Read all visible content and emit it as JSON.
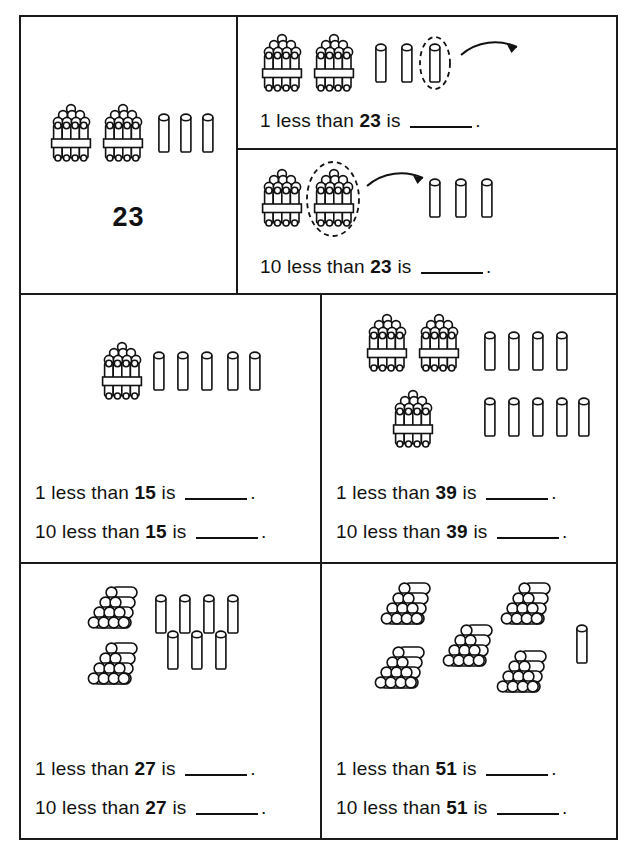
{
  "worksheet": {
    "title": "1 less and 10 less than a number - base ten worksheet",
    "grid": {
      "rows": 3,
      "columns": 2
    }
  },
  "cells": [
    {
      "id": "cell-reference-23",
      "kind": "reference",
      "number_label": "23",
      "manipulatives": {
        "bundles_of_ten": 2,
        "single_units": 3,
        "unit_style": "vertical-cylinder"
      }
    },
    {
      "id": "cell-1-less-than-23",
      "kind": "worked-example",
      "statement": {
        "prefix": "1 less than",
        "number": "23",
        "suffix": "is",
        "blank": "",
        "period": "."
      },
      "manipulatives": {
        "bundles_of_ten": 2,
        "single_units": 3,
        "unit_style": "vertical-cylinder"
      },
      "annotation": {
        "circled": "last-single-unit",
        "circle_style": "dashed-oval",
        "arrow": "points-right-away"
      }
    },
    {
      "id": "cell-10-less-than-23",
      "kind": "worked-example",
      "statement": {
        "prefix": "10 less than",
        "number": "23",
        "suffix": "is",
        "blank": "",
        "period": "."
      },
      "manipulatives": {
        "bundles_of_ten": 2,
        "single_units": 3,
        "unit_style": "vertical-cylinder"
      },
      "annotation": {
        "circled": "second-bundle-of-ten",
        "circle_style": "dashed-oval",
        "arrow": "points-right-away"
      }
    },
    {
      "id": "cell-15",
      "kind": "exercise",
      "manipulatives": {
        "bundles_of_ten": 1,
        "single_units": 5,
        "unit_style": "vertical-cylinder"
      },
      "statements": [
        {
          "prefix": "1 less than",
          "number": "15",
          "suffix": "is",
          "blank": "",
          "period": "."
        },
        {
          "prefix": "10 less than",
          "number": "15",
          "suffix": "is",
          "blank": "",
          "period": "."
        }
      ]
    },
    {
      "id": "cell-39",
      "kind": "exercise",
      "manipulatives": {
        "bundles_of_ten": 3,
        "single_units": 9,
        "unit_style": "vertical-cylinder"
      },
      "statements": [
        {
          "prefix": "1 less than",
          "number": "39",
          "suffix": "is",
          "blank": "",
          "period": "."
        },
        {
          "prefix": "10 less than",
          "number": "39",
          "suffix": "is",
          "blank": "",
          "period": "."
        }
      ]
    },
    {
      "id": "cell-27",
      "kind": "exercise",
      "manipulatives": {
        "stacks_of_ten": 2,
        "single_units": 7,
        "unit_style": "pyramid-stack"
      },
      "statements": [
        {
          "prefix": "1 less than",
          "number": "27",
          "suffix": "is",
          "blank": "",
          "period": "."
        },
        {
          "prefix": "10 less than",
          "number": "27",
          "suffix": "is",
          "blank": "",
          "period": "."
        }
      ]
    },
    {
      "id": "cell-51",
      "kind": "exercise",
      "manipulatives": {
        "stacks_of_ten": 5,
        "single_units": 1,
        "unit_style": "pyramid-stack"
      },
      "statements": [
        {
          "prefix": "1 less than",
          "number": "51",
          "suffix": "is",
          "blank": "",
          "period": "."
        },
        {
          "prefix": "10 less than",
          "number": "51",
          "suffix": "is",
          "blank": "",
          "period": "."
        }
      ]
    }
  ],
  "text": {
    "t_ref_number": "23",
    "s1_prefix": "1 less than",
    "s1_number": "23",
    "s1_suffix": "is",
    "s1_period": ".",
    "s2_prefix": "10 less than",
    "s2_number": "23",
    "s2_suffix": "is",
    "s2_period": ".",
    "s3_prefix": "1 less than",
    "s3_number": "15",
    "s3_suffix": "is",
    "s3_period": ".",
    "s4_prefix": "10 less than",
    "s4_number": "15",
    "s4_suffix": "is",
    "s4_period": ".",
    "s5_prefix": "1 less than",
    "s5_number": "39",
    "s5_suffix": "is",
    "s5_period": ".",
    "s6_prefix": "10 less than",
    "s6_number": "39",
    "s6_suffix": "is",
    "s6_period": ".",
    "s7_prefix": "1 less than",
    "s7_number": "27",
    "s7_suffix": "is",
    "s7_period": ".",
    "s8_prefix": "10 less than",
    "s8_number": "27",
    "s8_suffix": "is",
    "s8_period": ".",
    "s9_prefix": "1 less than",
    "s9_number": "51",
    "s9_suffix": "is",
    "s9_period": ".",
    "s10_prefix": "10 less than",
    "s10_number": "51",
    "s10_suffix": "is",
    "s10_period": "."
  },
  "colors": {
    "ink": "#111111",
    "paper": "#ffffff"
  }
}
